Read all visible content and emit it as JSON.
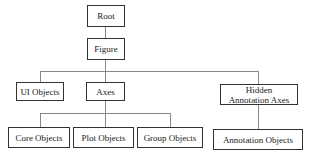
{
  "diagram": {
    "type": "hierarchy-tree",
    "nodes": {
      "root": "Root",
      "figure": "Figure",
      "ui_objects": "UI Objects",
      "axes": "Axes",
      "hidden_annotation_axes_line1": "Hidden",
      "hidden_annotation_axes_line2": "Annotation Axes",
      "core_objects": "Core Objects",
      "plot_objects": "Plot Objects",
      "group_objects": "Group Objects",
      "annotation_objects": "Annotation Objects"
    },
    "edges": [
      [
        "Root",
        "Figure"
      ],
      [
        "Figure",
        "UI Objects"
      ],
      [
        "Figure",
        "Axes"
      ],
      [
        "Figure",
        "Hidden Annotation Axes"
      ],
      [
        "Axes",
        "Core Objects"
      ],
      [
        "Axes",
        "Plot Objects"
      ],
      [
        "Axes",
        "Group Objects"
      ],
      [
        "Hidden Annotation Axes",
        "Annotation Objects"
      ]
    ]
  }
}
